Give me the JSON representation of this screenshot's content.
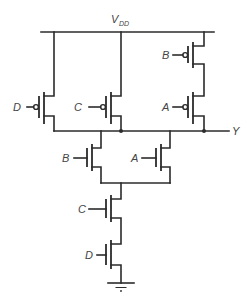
{
  "diagram": {
    "title": "",
    "supply_label": "V",
    "supply_subscript": "DD",
    "output_label": "Y",
    "pull_up_network": [
      {
        "type": "pmos",
        "gate": "D"
      },
      {
        "type": "pmos",
        "gate": "C"
      },
      {
        "type": "pmos",
        "gate": "B"
      },
      {
        "type": "pmos",
        "gate": "A"
      }
    ],
    "pull_down_network": [
      {
        "type": "nmos",
        "gate": "B"
      },
      {
        "type": "nmos",
        "gate": "A"
      },
      {
        "type": "nmos",
        "gate": "C"
      },
      {
        "type": "nmos",
        "gate": "D"
      }
    ],
    "labels": {
      "pmos_d": "D",
      "pmos_c": "C",
      "pmos_b": "B",
      "pmos_a": "A",
      "nmos_b": "B",
      "nmos_a": "A",
      "nmos_c": "C",
      "nmos_d": "D"
    },
    "colors": {
      "wire": "#2b2b2b",
      "text": "#444444",
      "background": "#ffffff"
    }
  }
}
